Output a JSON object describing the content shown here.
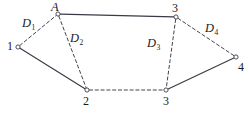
{
  "figure": {
    "type": "node-network-diagram",
    "width": 249,
    "height": 115,
    "background_color": "#ffffff",
    "line_color": "#3a3a46",
    "text_color": "#1b1b1b"
  },
  "nodes": [
    {
      "id": "A",
      "label": "A",
      "x": 58,
      "y": 14,
      "label_x": 51,
      "label_y": 1,
      "italic": true
    },
    {
      "id": "n1",
      "label": "1",
      "x": 18,
      "y": 47,
      "label_x": 7,
      "label_y": 40,
      "italic": false
    },
    {
      "id": "n2",
      "label": "2",
      "x": 87,
      "y": 90,
      "label_x": 83,
      "label_y": 95,
      "italic": false
    },
    {
      "id": "t3",
      "label": "3",
      "x": 176,
      "y": 17,
      "label_x": 172,
      "label_y": 2,
      "italic": false
    },
    {
      "id": "b3",
      "label": "3",
      "x": 166,
      "y": 90,
      "label_x": 163,
      "label_y": 95,
      "italic": false
    },
    {
      "id": "n4",
      "label": "4",
      "x": 236,
      "y": 57,
      "label_x": 238,
      "label_y": 61,
      "italic": false
    }
  ],
  "edges": [
    {
      "id": "e-A-t3",
      "from": "A",
      "to": "t3",
      "style": "solid",
      "label": null
    },
    {
      "id": "e-n1-n2",
      "from": "n1",
      "to": "n2",
      "style": "solid",
      "label": null
    },
    {
      "id": "e-b3-n4",
      "from": "b3",
      "to": "n4",
      "style": "solid",
      "label": null
    },
    {
      "id": "e-n1-A",
      "from": "n1",
      "to": "A",
      "style": "dashed",
      "label": "D1"
    },
    {
      "id": "e-A-n2",
      "from": "A",
      "to": "n2",
      "style": "dashed",
      "label": "D2"
    },
    {
      "id": "e-t3-b3",
      "from": "t3",
      "to": "b3",
      "style": "dashed",
      "label": "D3"
    },
    {
      "id": "e-t3-n4",
      "from": "t3",
      "to": "n4",
      "style": "dashed",
      "label": "D4"
    },
    {
      "id": "e-n2-b3",
      "from": "n2",
      "to": "b3",
      "style": "dashed",
      "label": null
    }
  ],
  "distance_labels": [
    {
      "id": "D1",
      "base": "D",
      "sub": "1",
      "x": 22,
      "y": 17
    },
    {
      "id": "D2",
      "base": "D",
      "sub": "2",
      "x": 70,
      "y": 32
    },
    {
      "id": "D3",
      "base": "D",
      "sub": "3",
      "x": 147,
      "y": 37
    },
    {
      "id": "D4",
      "base": "D",
      "sub": "4",
      "x": 205,
      "y": 22
    }
  ]
}
